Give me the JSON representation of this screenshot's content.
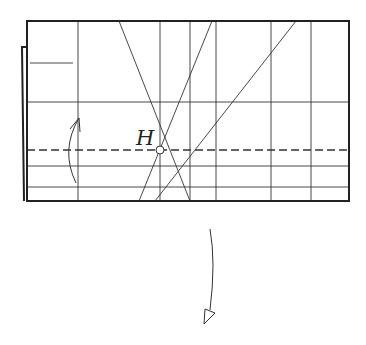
{
  "diagram": {
    "type": "origami-fold-step",
    "colors": {
      "line": "#333333",
      "border": "#222222",
      "background": "#ffffff"
    },
    "paper": {
      "x1": 27,
      "y1": 21,
      "x2": 349,
      "y2": 201
    },
    "back_flap": {
      "points": "27,47 22,47 24,201"
    },
    "short_crease": {
      "x1": 30,
      "y1": 63,
      "x2": 73,
      "y2": 63
    },
    "vertical_creases": [
      78,
      160,
      190,
      216,
      271,
      311
    ],
    "horizontal_creases": [
      102,
      166,
      187
    ],
    "valley_fold_line": {
      "y": 150,
      "dash": "8,4"
    },
    "diagonal_creases": [
      {
        "x1": 119,
        "y1": 21,
        "x2": 190,
        "y2": 201
      },
      {
        "x1": 212,
        "y1": 21,
        "x2": 139,
        "y2": 201
      },
      {
        "x1": 296,
        "y1": 21,
        "x2": 155,
        "y2": 201
      }
    ],
    "reference_point": {
      "label": "H",
      "cx": 160,
      "cy": 150,
      "r": 4,
      "label_x": 136,
      "label_y": 145
    },
    "fold_up_arrow": {
      "path": "M76,183 Q60,150 79,118",
      "head": "M70,129 L79,118 L80,132"
    },
    "turn_over_arrow": {
      "path": "M210,229 Q216,262 210,310",
      "head": "M205,309 L204,324 L215,313 Z"
    }
  }
}
